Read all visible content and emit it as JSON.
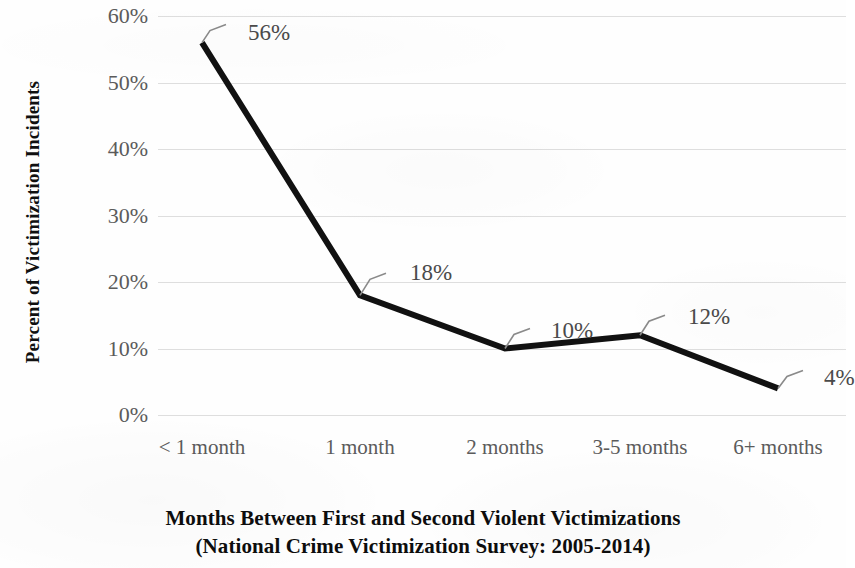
{
  "chart_data": {
    "type": "line",
    "title": "",
    "xlabel": "Months Between First and Second Violent Victimizations (National Crime Victimization Survey: 2005-2014)",
    "ylabel": "Percent of Victimization Incidents",
    "categories": [
      "< 1 month",
      "1 month",
      "2 months",
      "3-5 months",
      "6+ months"
    ],
    "values": [
      56,
      18,
      10,
      12,
      4
    ],
    "data_labels": [
      "56%",
      "18%",
      "10%",
      "12%",
      "4%"
    ],
    "ylim": [
      0,
      60
    ],
    "ytick_values": [
      60,
      50,
      40,
      30,
      20,
      10,
      0
    ],
    "ytick_labels": [
      "60%",
      "50%",
      "40%",
      "30%",
      "20%",
      "10%",
      "0%"
    ],
    "grid": true,
    "grid_axis": "y",
    "legend": false,
    "legend_position": "none",
    "series": [
      {
        "name": "Percent of Victimization Incidents",
        "values": [
          56,
          18,
          10,
          12,
          4
        ],
        "color": "#111111",
        "line_width": 6,
        "markers": false
      }
    ],
    "colors": {
      "line": "#111111",
      "gridline": "#d8d8d8",
      "tick_label": "#5b5b5b",
      "axis_title": "#0d0d0d",
      "data_label": "#4a4a4a",
      "background": "#fefefe"
    }
  },
  "axes": {
    "y_title": "Percent of Victimization Incidents",
    "x_title_line1": "Months Between First and Second Violent Victimizations",
    "x_title_line2": "(National Crime Victimization Survey: 2005-2014)"
  }
}
